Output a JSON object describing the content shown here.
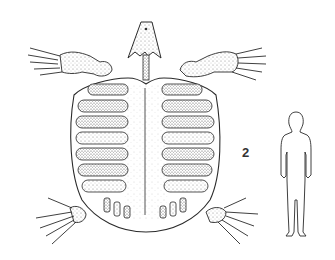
{
  "figure": {
    "label": "2",
    "subjects": [
      {
        "name": "turtle-skeleton",
        "view": "dorsal carapace with limbs and skull"
      },
      {
        "name": "human-silhouette",
        "role": "scale reference"
      }
    ],
    "colors": {
      "line": "#2a2a2a",
      "stipple": "#9a9a9a",
      "background": "#ffffff"
    }
  }
}
